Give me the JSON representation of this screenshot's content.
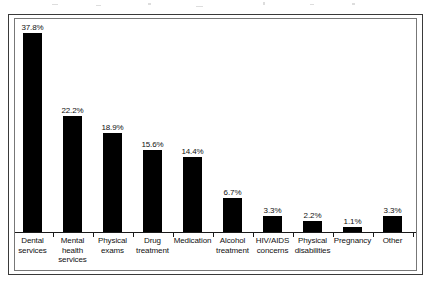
{
  "chart_data": {
    "type": "bar",
    "title": "",
    "subtitle": "",
    "xlabel": "",
    "ylabel": "",
    "ylim": [
      0,
      40
    ],
    "grid": false,
    "legend": "none",
    "orientation": "vertical",
    "bar_color": "#000000",
    "categories": [
      "Dental services",
      "Mental health services",
      "Physical exams",
      "Drug treatment",
      "Medication",
      "Alcohol treatment",
      "HIV/AIDS concerns",
      "Physical disabilities",
      "Pregnancy",
      "Other"
    ],
    "category_lines": [
      [
        "Dental",
        "services"
      ],
      [
        "Mental",
        "health",
        "services"
      ],
      [
        "Physical",
        "exams"
      ],
      [
        "Drug",
        "treatment"
      ],
      [
        "Medication"
      ],
      [
        "Alcohol",
        "treatment"
      ],
      [
        "HIV/AIDS",
        "concerns"
      ],
      [
        "Physical",
        "disabilities"
      ],
      [
        "Pregnancy"
      ],
      [
        "Other"
      ]
    ],
    "values": [
      37.8,
      22.2,
      18.9,
      15.6,
      14.4,
      6.7,
      3.3,
      2.2,
      1.1,
      3.3
    ],
    "value_labels": [
      "37.8%",
      "22.2%",
      "18.9%",
      "15.6%",
      "14.4%",
      "6.7%",
      "3.3%",
      "2.2%",
      "1.1%",
      "3.3%"
    ]
  },
  "colors": {
    "bar": "#000000",
    "outer_frame": "#3a3a3a",
    "plot_frame": "#777777",
    "axis": "#1a1a1a",
    "text": "#111111",
    "background": "#ffffff"
  }
}
